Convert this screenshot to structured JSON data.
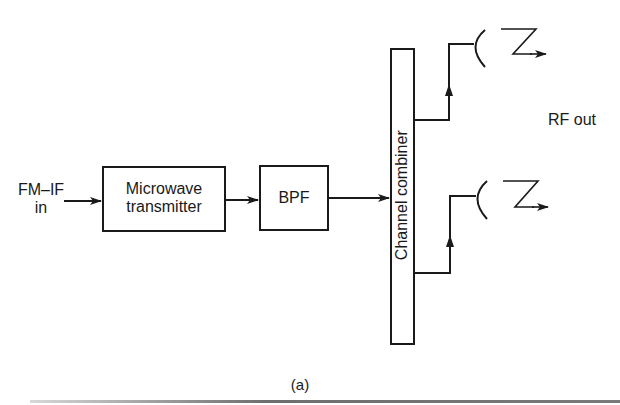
{
  "diagram": {
    "input_label_line1": "FM–IF",
    "input_label_line2": "in",
    "blocks": [
      {
        "id": "microwave-transmitter",
        "line1": "Microwave",
        "line2": "transmitter"
      },
      {
        "id": "bpf",
        "label": "BPF"
      },
      {
        "id": "channel-combiner",
        "label": "Channel combiner"
      }
    ],
    "output_label": "RF out",
    "caption": "(a)",
    "antennas": [
      {
        "id": "antenna-upper"
      },
      {
        "id": "antenna-lower"
      }
    ]
  },
  "colors": {
    "line": "#1a1a1a",
    "background": "#ffffff"
  }
}
